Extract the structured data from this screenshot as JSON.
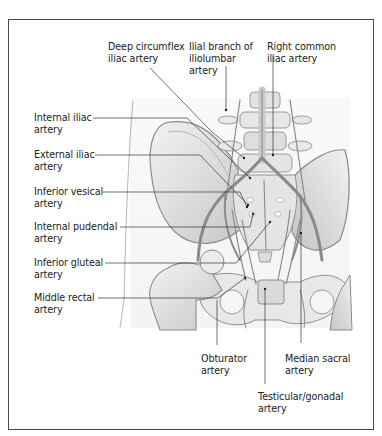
{
  "figure": {
    "type": "anatomical-illustration",
    "colors": {
      "frame_border": "#4a4a4a",
      "label_text": "#222222",
      "leader_line": "#333333",
      "bone_fill": "#e6e6e6",
      "bone_shade": "#bdbdbd",
      "vessel": "#8a8a8a"
    }
  },
  "labels": {
    "top": [
      {
        "id": "deep-circumflex-iliac",
        "line1": "Deep circumflex",
        "line2": "iliac artery",
        "line3": ""
      },
      {
        "id": "ilial-branch-iliolumbar",
        "line1": "Ilial branch of",
        "line2": "iliolumbar",
        "line3": "artery"
      },
      {
        "id": "right-common-iliac",
        "line1": "Right common",
        "line2": "iliac artery",
        "line3": ""
      }
    ],
    "left": [
      {
        "id": "internal-iliac",
        "line1": "Internal iliac",
        "line2": "artery"
      },
      {
        "id": "external-iliac",
        "line1": "External iliac",
        "line2": "artery"
      },
      {
        "id": "inferior-vesical",
        "line1": "Inferior vesical",
        "line2": "artery"
      },
      {
        "id": "internal-pudendal",
        "line1": "Internal pudendal",
        "line2": "artery"
      },
      {
        "id": "inferior-gluteal",
        "line1": "Inferior gluteal",
        "line2": "artery"
      },
      {
        "id": "middle-rectal",
        "line1": "Middle rectal",
        "line2": "artery"
      }
    ],
    "bottom": [
      {
        "id": "obturator",
        "line1": "Obturator",
        "line2": "artery"
      },
      {
        "id": "median-sacral",
        "line1": "Median sacral",
        "line2": "artery"
      },
      {
        "id": "testicular-gonadal",
        "line1": "Testicular/gonadal",
        "line2": "artery"
      }
    ]
  }
}
